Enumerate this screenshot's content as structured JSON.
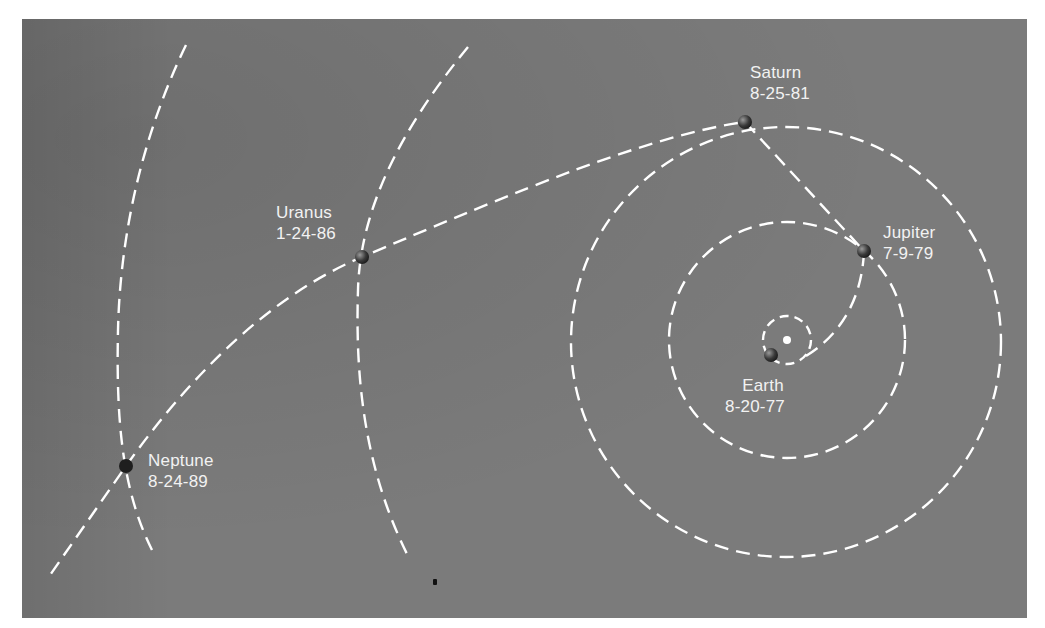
{
  "diagram": {
    "type": "spacecraft trajectory diagram",
    "colors": {
      "background": "#7b7b7b",
      "lines": "#ffffff",
      "labels": "#f2f2f2",
      "sun": "#ffffff",
      "planet": "#3a3a3a"
    },
    "sun": {
      "x": 787,
      "y": 340
    },
    "encounters": [
      {
        "id": "earth",
        "name": "Earth",
        "date": "8-20-77"
      },
      {
        "id": "jupiter",
        "name": "Jupiter",
        "date": "7-9-79"
      },
      {
        "id": "saturn",
        "name": "Saturn",
        "date": "8-25-81"
      },
      {
        "id": "uranus",
        "name": "Uranus",
        "date": "1-24-86"
      },
      {
        "id": "neptune",
        "name": "Neptune",
        "date": "8-24-89"
      }
    ]
  }
}
